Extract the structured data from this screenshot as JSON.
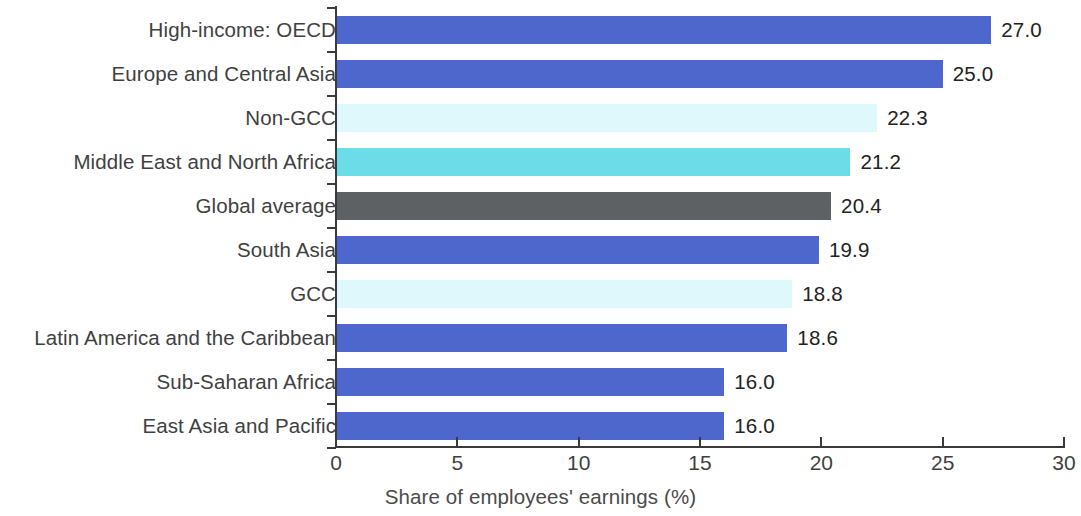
{
  "chart_data": {
    "type": "bar",
    "orientation": "horizontal",
    "title": "",
    "xlabel": "Share of employees' earnings (%)",
    "ylabel": "",
    "xlim": [
      0,
      30
    ],
    "xticks": [
      0,
      5,
      10,
      15,
      20,
      25,
      30
    ],
    "xtick_labels": [
      "0",
      "5",
      "10",
      "15",
      "20",
      "25",
      "30"
    ],
    "grid": false,
    "legend": null,
    "categories": [
      "High-income: OECD",
      "Europe and Central Asia",
      "Non-GCC",
      "Middle East and North Africa",
      "Global average",
      "South Asia",
      "GCC",
      "Latin America and the Caribbean",
      "Sub-Saharan Africa",
      "East Asia and Pacific"
    ],
    "values": [
      27.0,
      25.0,
      22.3,
      21.2,
      20.4,
      19.9,
      18.8,
      18.6,
      16.0,
      16.0
    ],
    "value_labels": [
      "27.0",
      "25.0",
      "22.3",
      "21.2",
      "20.4",
      "19.9",
      "18.8",
      "18.6",
      "16.0",
      "16.0"
    ],
    "bar_colors": [
      "#4E67CC",
      "#4E67CC",
      "#DEF8FC",
      "#6CDCE8",
      "#5E6164",
      "#4E67CC",
      "#DEF8FC",
      "#4E67CC",
      "#4E67CC",
      "#4E67CC"
    ],
    "palette": {
      "region_blue": "#4E67CC",
      "pale_cyan": "#DEF8FC",
      "turquoise": "#6CDCE8",
      "global_gray": "#5E6164",
      "axis": "#3A3A3A",
      "text": "#3F3F3F"
    }
  }
}
